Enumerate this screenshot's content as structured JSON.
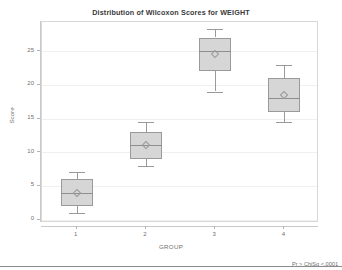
{
  "chart_data": {
    "type": "box",
    "title": "Distribution of Wilcoxon Scores for WEIGHT",
    "xlabel": "GROUP",
    "ylabel": "Score",
    "categories": [
      "1",
      "2",
      "3",
      "4"
    ],
    "ylim": [
      -0.5,
      29.3
    ],
    "yticks": [
      0,
      5,
      10,
      15,
      20,
      25
    ],
    "ytick_labels": [
      "0",
      "5",
      "10",
      "15",
      "20",
      "25"
    ],
    "grid": true,
    "legend": "none",
    "annotation": "Pr > ChiSq   <.0001",
    "boxes": [
      {
        "category": "1",
        "whisker_low": 1.0,
        "q1": 2.0,
        "median": 4.0,
        "q3": 6.0,
        "whisker_high": 7.0,
        "mean": 4.0
      },
      {
        "category": "2",
        "whisker_low": 8.0,
        "q1": 9.0,
        "median": 11.0,
        "q3": 13.0,
        "whisker_high": 14.5,
        "mean": 11.0
      },
      {
        "category": "3",
        "whisker_low": 19.0,
        "q1": 22.0,
        "median": 25.0,
        "q3": 27.0,
        "whisker_high": 28.2,
        "mean": 24.5
      },
      {
        "category": "4",
        "whisker_low": 14.5,
        "q1": 16.0,
        "median": 18.0,
        "q3": 21.0,
        "whisker_high": 23.0,
        "mean": 18.5
      }
    ],
    "colors": {
      "box_fill": "#d6d6d6",
      "box_edge": "#9a9a9a",
      "grid": "#f0f0f0",
      "axis": "#c9c9c9",
      "text": "#6f6f6f",
      "title": "#3a3a3a"
    }
  }
}
